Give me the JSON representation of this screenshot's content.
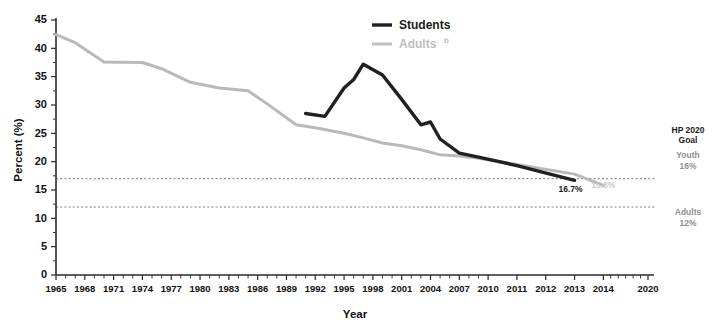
{
  "chart_data": {
    "type": "line",
    "title": "",
    "xlabel": "Year",
    "ylabel": "Percent (%)",
    "ylim": [
      0,
      45
    ],
    "ytick_step": 5,
    "yticks": [
      0,
      5,
      10,
      15,
      20,
      25,
      30,
      35,
      40,
      45
    ],
    "grid": false,
    "legend_position": "top-center",
    "xtick_labels": [
      "1965",
      "1968",
      "1971",
      "1974",
      "1977",
      "1980",
      "1983",
      "1986",
      "1989",
      "1992",
      "1995",
      "1998",
      "2001",
      "2004",
      "2007",
      "2010",
      "2011",
      "2012",
      "2013",
      "2014",
      "2020"
    ],
    "xtick_years": [
      1965,
      1968,
      1971,
      1974,
      1977,
      1980,
      1983,
      1986,
      1989,
      1992,
      1995,
      1998,
      2001,
      2004,
      2007,
      2010,
      2011,
      2012,
      2013,
      2014,
      2020
    ],
    "xlim": [
      1965,
      2020
    ],
    "series": [
      {
        "name": "Students",
        "legend_label": "Students",
        "legend_superscript": "",
        "color": "#231f20",
        "x": [
          1991,
          1993,
          1995,
          1996,
          1997,
          1999,
          2001,
          2003,
          2004,
          2005,
          2007,
          2009,
          2011,
          2013
        ],
        "values": [
          28.5,
          28.0,
          33.0,
          34.5,
          37.2,
          35.3,
          31.0,
          26.5,
          27.0,
          24.0,
          21.5,
          20.8,
          19.3,
          16.7
        ],
        "end_label": "16.7%"
      },
      {
        "name": "Adults",
        "legend_label": "Adults",
        "legend_superscript": "b",
        "color": "#b9b9b9",
        "x": [
          1965,
          1967,
          1970,
          1974,
          1976,
          1979,
          1982,
          1985,
          1987,
          1990,
          1992,
          1995,
          1997,
          1999,
          2001,
          2003,
          2005,
          2007,
          2009,
          2011,
          2013,
          2014
        ],
        "values": [
          42.4,
          41.0,
          37.6,
          37.5,
          36.4,
          34.0,
          33.0,
          32.5,
          30.2,
          26.5,
          26.0,
          25.0,
          24.2,
          23.3,
          22.8,
          22.1,
          21.2,
          21.0,
          20.6,
          19.5,
          17.8,
          15.8
        ],
        "end_label": "15.8%"
      }
    ],
    "goal_lines": [
      {
        "name": "Youth",
        "value": 17.0,
        "label_name": "Youth",
        "label_value": "16%",
        "color": "#8e8e8e"
      },
      {
        "name": "Adults",
        "value": 12.0,
        "label_name": "Adults",
        "label_value": "12%",
        "color": "#a5a5a5"
      }
    ],
    "goal_heading_line1": "HP 2020",
    "goal_heading_line2": "Goal"
  }
}
